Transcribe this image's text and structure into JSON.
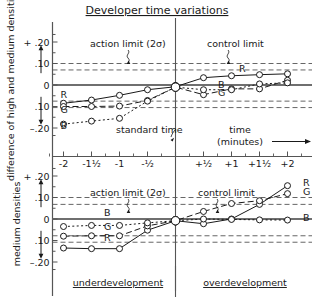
{
  "title": "Developer time variations",
  "axis": {
    "x_label_line1": "time",
    "x_label_line2": "(minutes)",
    "x_ticks": [
      "-2",
      "-1¹⁄₂",
      "-1",
      "-¹⁄₂",
      "+¹⁄₂",
      "+1",
      "+1¹⁄₂",
      "+2"
    ],
    "y_ticks": [
      "+ .20",
      ".10",
      "0",
      ".10",
      "–.20"
    ],
    "y_label_top": "difference of high and medium densities",
    "y_label_bottom": "medium  densities"
  },
  "annotations": {
    "action_limit": "action  limit (2σ)",
    "control_limit": "control   limit",
    "standard_time": "standard  time",
    "underdevelopment": "underdevelopment",
    "overdevelopment": "overdevelopment"
  },
  "series_labels": {
    "R": "R",
    "G": "G",
    "B": "B"
  },
  "colors": {
    "ink": "#1a1a1a",
    "grid": "#555555",
    "marker_fill": "#ffffff"
  },
  "chart_data": [
    {
      "type": "line",
      "title": "Developer time variations",
      "subtitle": "difference of high and medium densities",
      "xlabel": "time (minutes)",
      "ylabel": "difference of high and medium densities",
      "xlim": [
        -2.3,
        2.35
      ],
      "ylim": [
        -0.25,
        0.25
      ],
      "x": [
        -2,
        -1.5,
        -1,
        -0.5,
        0,
        0.5,
        1,
        1.5,
        2
      ],
      "grid": false,
      "legend": "inline-labels",
      "control_limits": [
        0.07,
        -0.075
      ],
      "action_limits": [
        0.1,
        -0.105
      ],
      "series": [
        {
          "name": "R",
          "values": [
            -0.085,
            -0.07,
            -0.048,
            -0.022,
            -0.008,
            0.034,
            0.043,
            0.048,
            0.052
          ]
        },
        {
          "name": "G",
          "values": [
            -0.1,
            -0.1,
            -0.098,
            -0.072,
            -0.01,
            -0.045,
            -0.018,
            -0.018,
            0.022
          ]
        },
        {
          "name": "B",
          "values": [
            -0.182,
            -0.168,
            -0.155,
            -0.075,
            -0.01,
            -0.022,
            -0.022,
            0.005,
            0.01
          ]
        }
      ]
    },
    {
      "type": "line",
      "title": "Developer time variations",
      "subtitle": "medium densities",
      "xlabel": "time (minutes)",
      "ylabel": "medium  densities",
      "xlim": [
        -2.3,
        2.35
      ],
      "ylim": [
        -0.25,
        0.25
      ],
      "x": [
        -2,
        -1.5,
        -1,
        -0.5,
        0,
        0.5,
        1,
        1.5,
        2
      ],
      "grid": false,
      "legend": "inline-labels",
      "control_limits": [
        0.068,
        -0.078
      ],
      "action_limits": [
        0.1,
        -0.108
      ],
      "series": [
        {
          "name": "R",
          "values": [
            -0.135,
            -0.138,
            -0.138,
            -0.052,
            -0.008,
            -0.022,
            0.0,
            0.068,
            0.155
          ]
        },
        {
          "name": "G",
          "values": [
            -0.08,
            -0.078,
            -0.078,
            -0.032,
            -0.008,
            0.035,
            0.072,
            0.085,
            0.118
          ]
        },
        {
          "name": "B",
          "values": [
            -0.035,
            -0.03,
            -0.03,
            -0.018,
            -0.008,
            0.0,
            -0.002,
            -0.004,
            -0.005
          ]
        }
      ]
    }
  ]
}
